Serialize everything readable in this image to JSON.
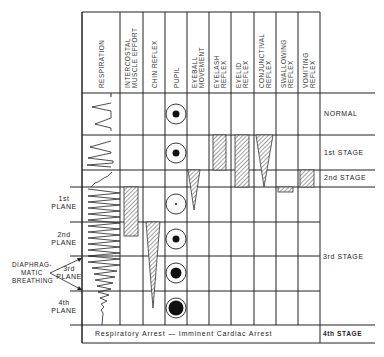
{
  "columns": [
    {
      "key": "respiration",
      "label": "RESPIRATION"
    },
    {
      "key": "intercostal",
      "label": "INTERCOSTAL\nMUSCLE EFFORT"
    },
    {
      "key": "chin",
      "label": "CHIN REFLEX"
    },
    {
      "key": "pupil",
      "label": "PUPIL"
    },
    {
      "key": "eyeball",
      "label": "EYEBALL\nMOVEMENT"
    },
    {
      "key": "eyelash",
      "label": "EYELASH\nREFLEX"
    },
    {
      "key": "eyelid",
      "label": "EYELID\nREFLEX"
    },
    {
      "key": "conjunctival",
      "label": "CONJUNCTIVAL\nREFLEX"
    },
    {
      "key": "swallowing",
      "label": "SWALLOWING\nREFLEX"
    },
    {
      "key": "vomiting",
      "label": "VOMITING\nREFLEX"
    }
  ],
  "stages": {
    "normal": "NORMAL",
    "stage1": "1st STAGE",
    "stage2": "2nd STAGE",
    "stage3": "3rd STAGE",
    "stage4": "4th STAGE"
  },
  "planes": {
    "plane1": "1st\nPLANE",
    "plane2": "2nd\nPLANE",
    "plane3": "3rd\nPLANE",
    "plane4": "4th\nPLANE"
  },
  "diaphragmatic": "DIAPHRAG-\nMATIC\nBREATHING",
  "arrest": "Respiratory Arrest — Imminent Cardiac Arrest",
  "pupil_sizes": [
    "normal-medium",
    "stage1-medium",
    "plane1-pinpoint",
    "plane2-small",
    "plane3-large",
    "plane4-dilated"
  ]
}
